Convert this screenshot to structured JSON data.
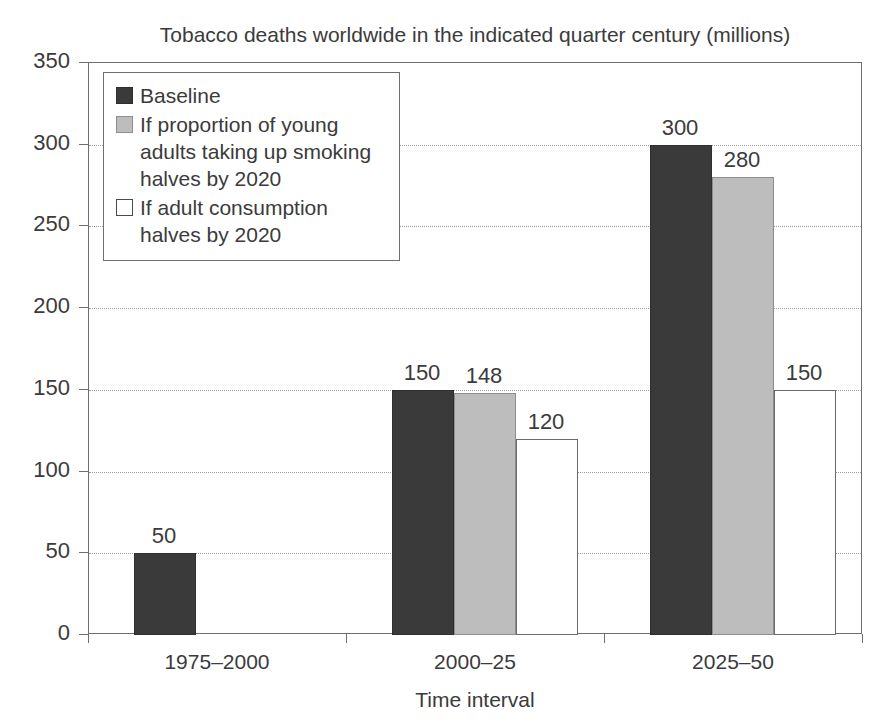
{
  "chart_data": {
    "type": "bar",
    "title": "Tobacco deaths worldwide in the indicated quarter century (millions)",
    "xlabel": "Time interval",
    "ylabel": "",
    "categories": [
      "1975–2000",
      "2000–25",
      "2025–50"
    ],
    "ylim": [
      0,
      350
    ],
    "ytick_labels": [
      "0",
      "50",
      "100",
      "150",
      "200",
      "250",
      "300",
      "350"
    ],
    "ytick_values": [
      0,
      50,
      100,
      150,
      200,
      250,
      300,
      350
    ],
    "grid": true,
    "grid_axis": "y",
    "legend_position": "upper left",
    "series": [
      {
        "name": "Baseline",
        "color": "#3a3a3a",
        "values": [
          50,
          150,
          300
        ],
        "labels": [
          "50",
          "150",
          "300"
        ]
      },
      {
        "name": "If proportion of young adults taking up smoking halves by 2020",
        "color": "#bdbdbd",
        "values": [
          null,
          148,
          280
        ],
        "labels": [
          "",
          "148",
          "280"
        ]
      },
      {
        "name": "If adult consumption halves by 2020",
        "color": "#ffffff",
        "values": [
          null,
          120,
          150
        ],
        "labels": [
          "",
          "120",
          "150"
        ]
      }
    ]
  },
  "legend": {
    "entries": [
      {
        "swatch": "dark",
        "label": "Baseline"
      },
      {
        "swatch": "gray",
        "label": "If proportion of young adults taking up smoking halves by 2020"
      },
      {
        "swatch": "white",
        "label": "If adult consumption halves by 2020"
      }
    ]
  },
  "axis": {
    "x_title": "Time interval"
  }
}
